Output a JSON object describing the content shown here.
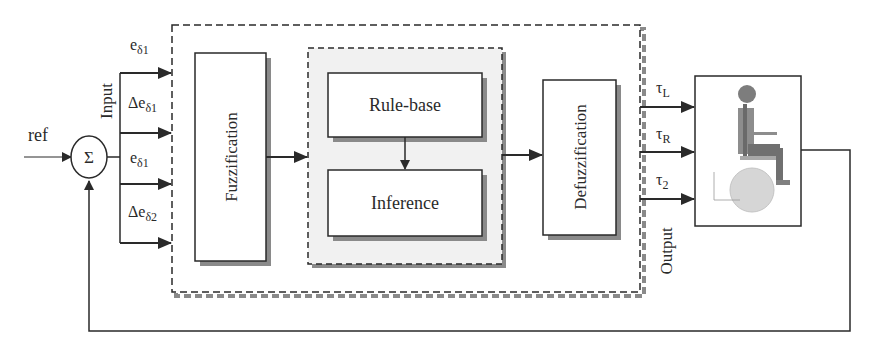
{
  "diagram": {
    "title": "",
    "reference": {
      "label": "ref"
    },
    "summing_junction": {
      "symbol": "Σ"
    },
    "input_group_label": "Input",
    "output_group_label": "Output",
    "inputs": [
      {
        "base": "e",
        "sub": "δ1"
      },
      {
        "base": "Δe",
        "sub": "δ1"
      },
      {
        "base": "e",
        "sub": "δ1"
      },
      {
        "base": "Δe",
        "sub": "δ2"
      }
    ],
    "blocks": {
      "fuzzification": "Fuzzification",
      "rule_base": "Rule-base",
      "inference": "Inference",
      "defuzzification": "Defuzzification",
      "plant": "wheelchair-with-occupant"
    },
    "outputs": [
      {
        "base": "τ",
        "sub": "L"
      },
      {
        "base": "τ",
        "sub": "R"
      },
      {
        "base": "τ",
        "sub": "2"
      }
    ],
    "colors": {
      "line": "#2a2a2a",
      "shadow": "#8a8a8a",
      "inner_fill": "#f1f1f1",
      "figure_body": "#7d7d7d",
      "figure_wheel": "#d6d6d6"
    }
  }
}
